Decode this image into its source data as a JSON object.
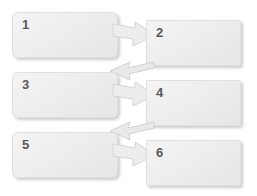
{
  "diagram": {
    "type": "process-flow",
    "background_color": "#ffffff",
    "box_fill_color": "#eeeeee",
    "box_border_color": "#e0e0e0",
    "label_color": "#58595b",
    "arrow_fill_color": "#ececec",
    "arrow_border_color": "#d8d8d8",
    "boxes": [
      {
        "id": "box-1",
        "label": "1",
        "column": "left",
        "row": 1,
        "x": 12,
        "y": 12,
        "width": 106,
        "height": 46,
        "corner": "rounded"
      },
      {
        "id": "box-2",
        "label": "2",
        "column": "right",
        "row": 1,
        "x": 146,
        "y": 20,
        "width": 95,
        "height": 46,
        "corner": "sharp"
      },
      {
        "id": "box-3",
        "label": "3",
        "column": "left",
        "row": 2,
        "x": 12,
        "y": 72,
        "width": 106,
        "height": 46,
        "corner": "rounded"
      },
      {
        "id": "box-4",
        "label": "4",
        "column": "right",
        "row": 2,
        "x": 146,
        "y": 80,
        "width": 95,
        "height": 46,
        "corner": "sharp"
      },
      {
        "id": "box-5",
        "label": "5",
        "column": "left",
        "row": 3,
        "x": 12,
        "y": 132,
        "width": 106,
        "height": 46,
        "corner": "rounded"
      },
      {
        "id": "box-6",
        "label": "6",
        "column": "right",
        "row": 3,
        "x": 146,
        "y": 140,
        "width": 95,
        "height": 46,
        "corner": "sharp"
      }
    ],
    "connectors": [
      {
        "id": "arrow-1-to-2",
        "from": "box-1",
        "to": "box-2",
        "direction": "right-down",
        "style": "block-arrow"
      },
      {
        "id": "arrow-2-to-3",
        "from": "box-2",
        "to": "box-3",
        "direction": "left-down",
        "style": "flat-arrow"
      },
      {
        "id": "arrow-3-to-4",
        "from": "box-3",
        "to": "box-4",
        "direction": "right-down",
        "style": "block-arrow"
      },
      {
        "id": "arrow-4-to-5",
        "from": "box-4",
        "to": "box-5",
        "direction": "left-down",
        "style": "flat-arrow"
      },
      {
        "id": "arrow-5-to-6",
        "from": "box-5",
        "to": "box-6",
        "direction": "right-down",
        "style": "block-arrow"
      }
    ]
  }
}
